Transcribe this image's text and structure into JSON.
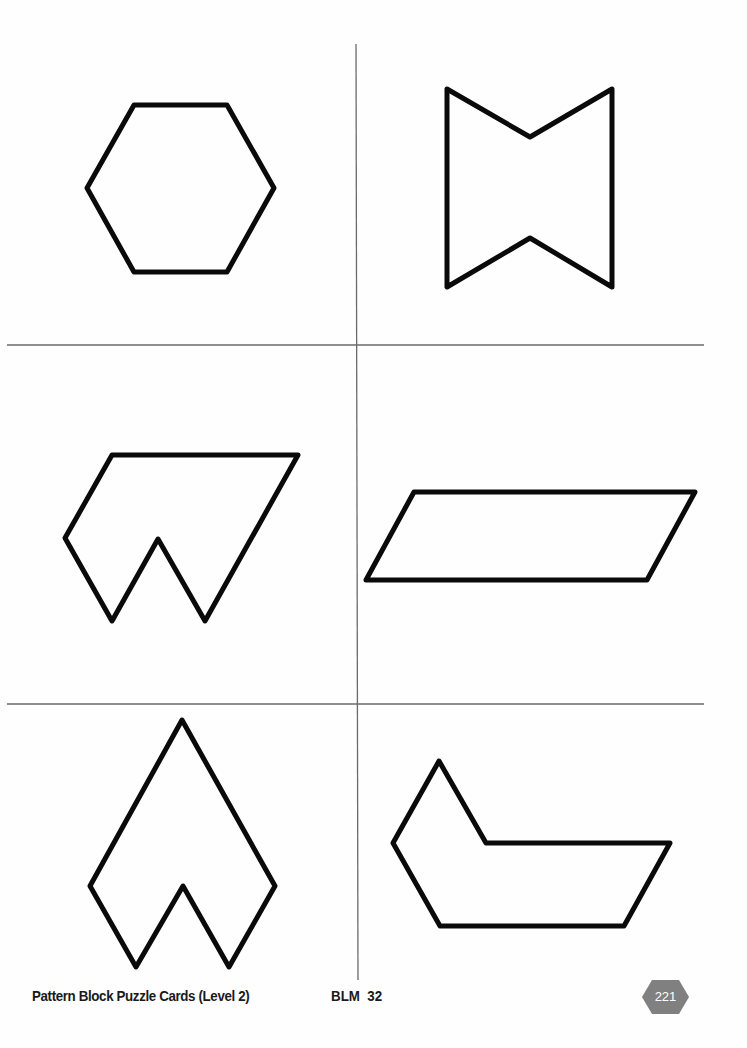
{
  "document": {
    "footer": {
      "title": "Pattern Block Puzzle Cards (Level 2)",
      "code": "BLM  32",
      "page_number": "221"
    },
    "colors": {
      "outline": "#0a0a0a",
      "grid_line": "#6a6a6a",
      "badge_fill": "#808080",
      "badge_text": "#ffffff",
      "background": "#fefefe"
    },
    "cards": [
      {
        "id": 1,
        "shape": "hexagon",
        "position": "top-left",
        "points": "134,105 227,105 274,188 227,272 134,272 87,188"
      },
      {
        "id": 2,
        "shape": "bowtie",
        "position": "top-right",
        "points": "447,89 530,137 612,89 612,287 530,238 447,287"
      },
      {
        "id": 3,
        "shape": "notched-trapezoid",
        "position": "middle-left",
        "points": "112,455 298,455 205,621 158,539 112,621 65,538"
      },
      {
        "id": 4,
        "shape": "parallelogram",
        "position": "middle-right",
        "points": "414,492 695,492 647,580 366,580"
      },
      {
        "id": 5,
        "shape": "arrowhead",
        "position": "bottom-left",
        "points": "182,720 275,886 229,967 183,886 136,967 90,886"
      },
      {
        "id": 6,
        "shape": "boot",
        "position": "bottom-right",
        "points": "439,761 486,843 670,843 624,926 440,926 393,843"
      }
    ],
    "grid": {
      "vertical": {
        "x1": 356,
        "y1": 44,
        "x2": 358,
        "y2": 980
      },
      "horizontal": [
        {
          "x1": 7,
          "y1": 345,
          "x2": 704,
          "y2": 345
        },
        {
          "x1": 7,
          "y1": 704,
          "x2": 704,
          "y2": 704
        }
      ]
    }
  }
}
